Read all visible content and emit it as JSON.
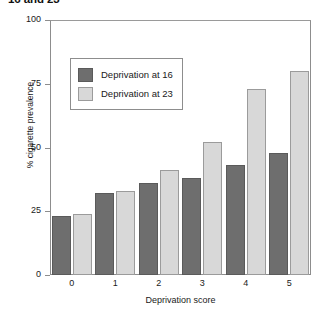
{
  "figure": {
    "title": "16 and 23"
  },
  "chart_data": {
    "type": "bar",
    "title": "16 and 23",
    "xlabel": "Deprivation score",
    "ylabel": "% cigarette prevalence",
    "categories": [
      "0",
      "1",
      "2",
      "3",
      "4",
      "5"
    ],
    "ylim": [
      0,
      100
    ],
    "yticks": [
      "0",
      "25",
      "50",
      "75",
      "100"
    ],
    "ytick_values": [
      0,
      25,
      50,
      75,
      100
    ],
    "grid": false,
    "legend_position": "upper-left-inside",
    "series": [
      {
        "name": "Deprivation at 16",
        "color": "#6e6e6e",
        "values": [
          23,
          32,
          36,
          38,
          43,
          48
        ]
      },
      {
        "name": "Deprivation at 23",
        "color": "#d8d8d8",
        "values": [
          24,
          33,
          41,
          52,
          73,
          80
        ]
      }
    ]
  }
}
